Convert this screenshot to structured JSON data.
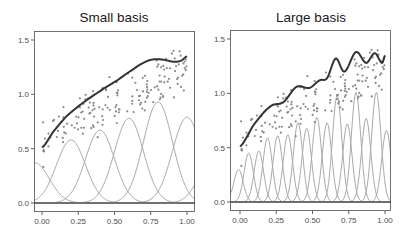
{
  "chart_data": [
    {
      "type": "line",
      "title": "Small basis",
      "xlabel": "",
      "ylabel": "",
      "xlim": [
        0,
        1
      ],
      "ylim": [
        0,
        1.55
      ],
      "xticks": [
        "0.00",
        "0.25",
        "0.50",
        "0.75",
        "1.00"
      ],
      "yticks": [
        "0.0",
        "0.5",
        "1.0",
        "1.5"
      ],
      "grid": false,
      "legend": null,
      "series": [
        {
          "name": "fit",
          "kind": "line",
          "color": "#333333",
          "x": [
            0.0,
            0.08,
            0.17,
            0.28,
            0.4,
            0.52,
            0.63,
            0.7,
            0.76,
            0.83,
            0.91,
            0.96,
            1.0
          ],
          "y": [
            0.51,
            0.66,
            0.8,
            0.92,
            1.03,
            1.13,
            1.23,
            1.29,
            1.32,
            1.32,
            1.3,
            1.31,
            1.35
          ]
        },
        {
          "name": "basis",
          "kind": "basis",
          "color": "#aaaaaa",
          "centers": [
            -0.05,
            0.2,
            0.4,
            0.6,
            0.8,
            1.0,
            1.2
          ],
          "heights": [
            0.37,
            0.58,
            0.67,
            0.78,
            0.93,
            0.79,
            0.5
          ],
          "width": 0.1
        }
      ],
      "points_note": "scatter of ~150 noisy observations around fit"
    },
    {
      "type": "line",
      "title": "Large basis",
      "xlabel": "",
      "ylabel": "",
      "xlim": [
        0,
        1
      ],
      "ylim": [
        0,
        1.55
      ],
      "xticks": [
        "0.00",
        "0.25",
        "0.50",
        "0.75",
        "1.00"
      ],
      "yticks": [
        "0.0",
        "0.5",
        "1.0",
        "1.5"
      ],
      "grid": false,
      "legend": null,
      "series": [
        {
          "name": "fit",
          "kind": "line",
          "color": "#333333",
          "x": [
            0.0,
            0.1,
            0.21,
            0.3,
            0.39,
            0.48,
            0.55,
            0.6,
            0.66,
            0.72,
            0.8,
            0.87,
            0.93,
            0.98,
            1.0
          ],
          "y": [
            0.51,
            0.72,
            0.88,
            0.92,
            1.06,
            1.05,
            1.12,
            1.14,
            1.32,
            1.2,
            1.38,
            1.28,
            1.37,
            1.28,
            1.35
          ]
        },
        {
          "name": "basis",
          "kind": "basis",
          "color": "#aaaaaa",
          "centers": [
            -0.01,
            0.06,
            0.13,
            0.19,
            0.26,
            0.33,
            0.4,
            0.46,
            0.53,
            0.6,
            0.67,
            0.74,
            0.8,
            0.87,
            0.94,
            1.01
          ],
          "heights": [
            0.3,
            0.45,
            0.47,
            0.59,
            0.61,
            0.62,
            0.73,
            0.68,
            0.78,
            0.73,
            0.98,
            0.72,
            1.01,
            0.77,
            1.01,
            0.66
          ],
          "width": 0.032
        }
      ],
      "points_note": "same scatter data as left panel"
    }
  ]
}
